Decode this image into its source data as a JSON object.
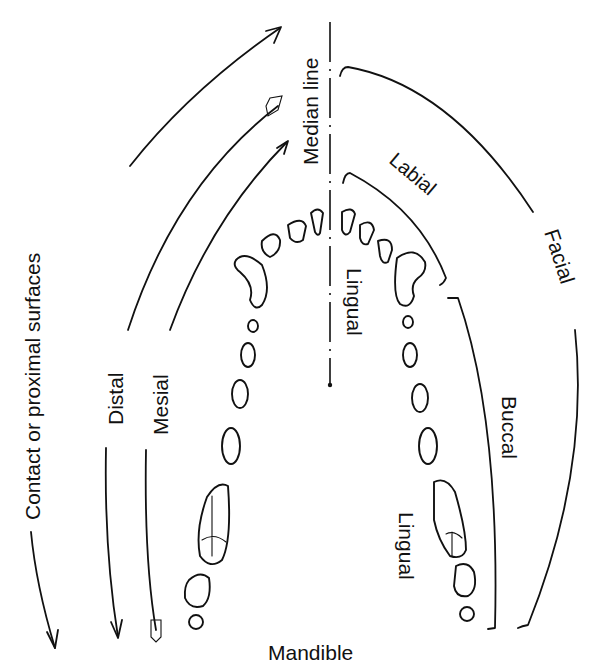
{
  "diagram": {
    "type": "dental-arch-surface-terminology",
    "jaw": "Mandible",
    "labels": {
      "median_line": "Median line",
      "labial": "Labial",
      "facial": "Facial",
      "lingual_anterior": "Lingual",
      "buccal": "Buccal",
      "lingual_posterior": "Lingual",
      "contact": "Contact or proximal surfaces",
      "distal": "Distal",
      "mesial": "Mesial",
      "mandible": "Mandible"
    },
    "arrows": [
      {
        "name": "contact-arrow",
        "label": "Contact or proximal surfaces",
        "head": "open-arrowhead"
      },
      {
        "name": "distal-arrow",
        "label": "Distal",
        "head": "open-arrowhead"
      },
      {
        "name": "mesial-arrow",
        "label": "Mesial",
        "head": "feathered-tail"
      }
    ],
    "colors": {
      "ink": "#111111",
      "paper": "#ffffff"
    }
  }
}
